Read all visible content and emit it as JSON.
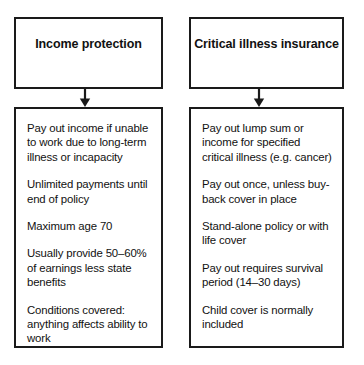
{
  "diagram": {
    "type": "two-column-flowchart",
    "colors": {
      "border": "#1a1a1a",
      "background": "#ffffff",
      "text": "#111111"
    },
    "columns": [
      {
        "id": "income-protection",
        "header": "Income protection",
        "arrow_icon": "down-arrow-icon",
        "items": [
          "Pay out income if unable to work due to long-term illness or incapacity",
          "Unlimited payments until end of policy",
          "Maximum age 70",
          "Usually provide 50–60% of earnings less state benefits",
          "Conditions covered: anything affects ability to work"
        ]
      },
      {
        "id": "critical-illness-insurance",
        "header": "Critical illness insurance",
        "arrow_icon": "down-arrow-icon",
        "items": [
          "Pay out lump sum or income for specified critical illness (e.g. cancer)",
          "Pay out once, unless buy-back cover in place",
          "Stand-alone policy or with life cover",
          "Pay out requires survival period (14–30 days)",
          "Child cover is normally included"
        ]
      }
    ]
  }
}
